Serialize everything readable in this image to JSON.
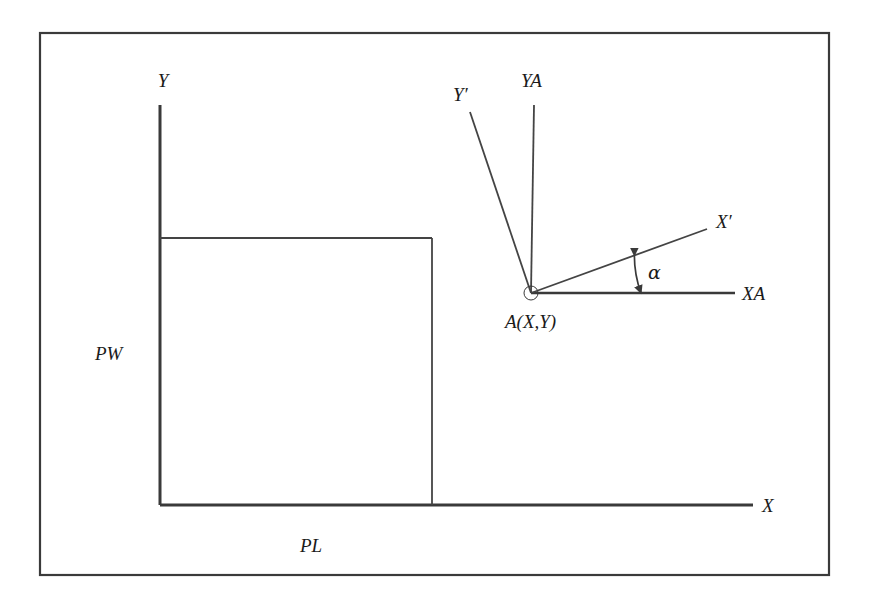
{
  "figure": {
    "background_color": "#ffffff",
    "line_color": "#3a3a3a",
    "text_color": "#1a1a1a",
    "border": {
      "name": "figure-frame",
      "x": 40,
      "y": 33,
      "width": 789,
      "height": 542
    },
    "labels": {
      "y_axis": "Y",
      "x_axis": "X",
      "plate_width": "PW",
      "plate_length": "PL",
      "local_y_prime": "Y′",
      "local_ya": "YA",
      "local_x_prime": "X′",
      "local_xa": "XA",
      "point_a": "A(X,Y)",
      "angle": "α"
    },
    "global_axes": {
      "name": "global-coordinate-axes",
      "origin": {
        "x": 160,
        "y": 505
      },
      "y_axis_top": {
        "x": 160,
        "y": 105
      },
      "x_axis_right": {
        "x": 753,
        "y": 505
      }
    },
    "plate_rectangle": {
      "name": "plate-rectangle",
      "x": 160,
      "y": 238,
      "width": 272,
      "height": 267
    },
    "point_a": {
      "name": "point-a-marker",
      "x": 531,
      "y": 293,
      "radius": 7
    },
    "local_axes": {
      "ya": {
        "from": {
          "x": 531,
          "y": 293
        },
        "to": {
          "x": 534,
          "y": 105
        }
      },
      "xa": {
        "from": {
          "x": 531,
          "y": 293
        },
        "to": {
          "x": 735,
          "y": 293
        }
      },
      "y_prime": {
        "from": {
          "x": 531,
          "y": 293
        },
        "to": {
          "x": 470,
          "y": 112
        }
      },
      "x_prime": {
        "from": {
          "x": 531,
          "y": 293
        },
        "to": {
          "x": 707,
          "y": 229
        }
      }
    },
    "angle_marker": {
      "name": "angle-alpha-arc",
      "vertex": {
        "x": 531,
        "y": 293
      },
      "radius": 110,
      "start_deg": 0,
      "end_deg": 20,
      "double_headed": true
    },
    "label_positions": {
      "y_axis": {
        "x": 163,
        "y": 87
      },
      "x_axis": {
        "x": 762,
        "y": 512
      },
      "plate_width": {
        "x": 95,
        "y": 360
      },
      "plate_length": {
        "x": 300,
        "y": 552
      },
      "local_y_prime": {
        "x": 453,
        "y": 101
      },
      "local_ya": {
        "x": 521,
        "y": 87
      },
      "local_x_prime": {
        "x": 716,
        "y": 228
      },
      "local_xa": {
        "x": 742,
        "y": 300
      },
      "point_a": {
        "x": 505,
        "y": 328
      },
      "angle": {
        "x": 648,
        "y": 279
      }
    }
  }
}
